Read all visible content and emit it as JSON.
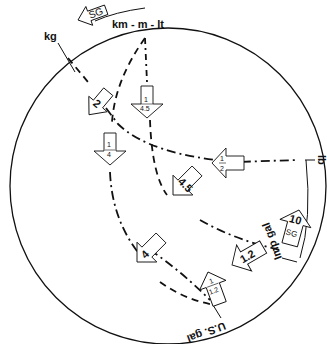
{
  "diagram": {
    "type": "unit-conversion-circle",
    "colors": {
      "line": "#111111",
      "background": "#ffffff"
    },
    "outer_labels": {
      "length": "km - m - lt",
      "mass": "kg",
      "pound": "lb",
      "imp_gallon": "Imp gal",
      "us_gallon": "U.S. gal"
    },
    "arrows": {
      "sg_outer": "SG",
      "kg_to_center": "2",
      "m_down": {
        "num": "1",
        "den": "4.5"
      },
      "left_quarter": {
        "num": "1",
        "den": "4"
      },
      "half": {
        "num": "1",
        "den": "2"
      },
      "four_five": "4.5",
      "four": "4",
      "one_two": "1.2",
      "one_over_one_two": {
        "num": "1",
        "den": "1.2"
      },
      "ten_sg": {
        "value": "10",
        "sub": "SG"
      }
    }
  }
}
